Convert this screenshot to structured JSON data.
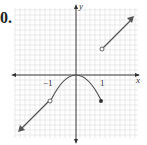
{
  "problem_number": "0.",
  "graph": {
    "axis_labels": {
      "x": "x",
      "y": "y"
    },
    "tick_labels": {
      "neg_one": "−1",
      "one": "1"
    },
    "colors": {
      "grid": "#d8d8d8",
      "axis": "#333333",
      "curve": "#555555"
    },
    "pieces": [
      {
        "type": "ray",
        "from": [
          -1,
          -1
        ],
        "direction": "down-left",
        "endpoint": "open"
      },
      {
        "type": "parabola",
        "equation": "y = -x^2",
        "domain": [
          -1,
          1
        ],
        "left_end": "open",
        "right_end": "closed"
      },
      {
        "type": "ray",
        "from": [
          1,
          1
        ],
        "direction": "up-right",
        "endpoint": "open"
      }
    ]
  }
}
